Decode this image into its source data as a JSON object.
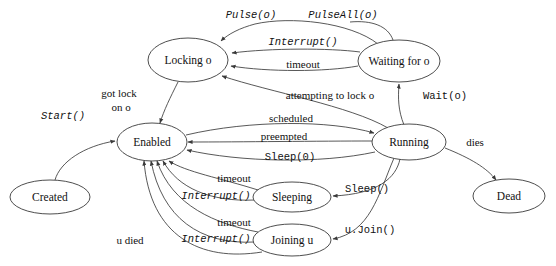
{
  "diagram": {
    "type": "state-machine",
    "stroke_color": "#3a3a3a",
    "fill_color": "#ffffff",
    "text_color": "#111111",
    "nodes": [
      {
        "id": "created",
        "label": "Created",
        "cx": 50,
        "cy": 197,
        "rx": 40,
        "ry": 17
      },
      {
        "id": "enabled",
        "label": "Enabled",
        "cx": 152,
        "cy": 142,
        "rx": 35,
        "ry": 19
      },
      {
        "id": "locking",
        "label": "Locking o",
        "cx": 188,
        "cy": 60,
        "rx": 40,
        "ry": 22
      },
      {
        "id": "waiting",
        "label": "Waiting for o",
        "cx": 399,
        "cy": 61,
        "rx": 41,
        "ry": 21
      },
      {
        "id": "running",
        "label": "Running",
        "cx": 409,
        "cy": 142,
        "rx": 37,
        "ry": 18
      },
      {
        "id": "dead",
        "label": "Dead",
        "cx": 509,
        "cy": 196,
        "rx": 36,
        "ry": 17
      },
      {
        "id": "sleeping",
        "label": "Sleeping",
        "cx": 292,
        "cy": 197,
        "rx": 39,
        "ry": 15
      },
      {
        "id": "joiningu",
        "label": "Joining u",
        "cx": 292,
        "cy": 240,
        "rx": 39,
        "ry": 16
      }
    ],
    "edges": [
      {
        "id": "start",
        "label": "Start()",
        "from": "created",
        "to": "enabled",
        "style": "mono-italic"
      },
      {
        "id": "pulse",
        "label": "Pulse(o)",
        "from": "waiting",
        "to": "locking",
        "style": "mono-italic"
      },
      {
        "id": "pulseall",
        "label": "PulseAll(o)",
        "from": "waiting",
        "to": "locking",
        "style": "mono-italic"
      },
      {
        "id": "interrupt-wait",
        "label": "Interrupt()",
        "from": "waiting",
        "to": "locking",
        "style": "mono-italic"
      },
      {
        "id": "timeout-wait",
        "label": "timeout",
        "from": "waiting",
        "to": "locking",
        "style": "serif"
      },
      {
        "id": "got-lock",
        "label": "got lock",
        "from": "locking",
        "to": "enabled",
        "style": "serif"
      },
      {
        "id": "got-lock-2",
        "label": "on o",
        "from": "locking",
        "to": "enabled",
        "style": "serif"
      },
      {
        "id": "attempting",
        "label": "attempting to lock o",
        "from": "running",
        "to": "locking",
        "style": "serif"
      },
      {
        "id": "wait-o",
        "label": "Wait(o)",
        "from": "running",
        "to": "waiting",
        "style": "mono-upright"
      },
      {
        "id": "scheduled",
        "label": "scheduled",
        "from": "enabled",
        "to": "running",
        "style": "serif"
      },
      {
        "id": "preempted",
        "label": "preempted",
        "from": "running",
        "to": "enabled",
        "style": "serif"
      },
      {
        "id": "sleep0",
        "label": "Sleep(0)",
        "from": "running",
        "to": "enabled",
        "style": "mono-upright"
      },
      {
        "id": "dies",
        "label": "dies",
        "from": "running",
        "to": "dead",
        "style": "serif"
      },
      {
        "id": "sleep",
        "label": "Sleep()",
        "from": "running",
        "to": "sleeping",
        "style": "mono-upright"
      },
      {
        "id": "ujoin",
        "label": "u.Join()",
        "from": "running",
        "to": "joiningu",
        "style": "mono-upright"
      },
      {
        "id": "timeout-sleep",
        "label": "timeout",
        "from": "sleeping",
        "to": "enabled",
        "style": "serif"
      },
      {
        "id": "interrupt-sleep",
        "label": "Interrupt()",
        "from": "sleeping",
        "to": "enabled",
        "style": "mono-italic"
      },
      {
        "id": "timeout-join",
        "label": "timeout",
        "from": "joiningu",
        "to": "enabled",
        "style": "serif"
      },
      {
        "id": "interrupt-join",
        "label": "Interrupt()",
        "from": "joiningu",
        "to": "enabled",
        "style": "mono-italic"
      },
      {
        "id": "u-died",
        "label": "u died",
        "from": "joiningu",
        "to": "enabled",
        "style": "serif"
      }
    ]
  }
}
